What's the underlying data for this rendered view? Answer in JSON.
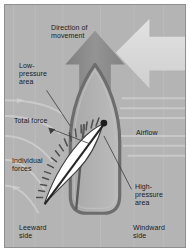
{
  "figure": {
    "background_color": "#b4b4b4",
    "border_color": "#8f8f8f",
    "page_color": "#ffffff"
  },
  "labels": {
    "direction_of_movement": "Direction of\nmovement",
    "low_pressure_area": "Low-\npressure\narea",
    "total_force": "Total force",
    "individual_forces": "Individual\nforces",
    "airflow": "Airflow",
    "high_pressure_area": "High-\npressure\narea",
    "leeward_side": "Leeward\nside",
    "windward_side": "Windward\nside"
  },
  "graphics": {
    "movement_arrow": {
      "name": "movement-arrow",
      "direction": "up",
      "color": "#8d8d8d"
    },
    "wind_arrow": {
      "name": "wind-arrow",
      "direction": "left",
      "color": "#d9d9d9"
    },
    "hull": {
      "name": "boat-hull",
      "outline_color": "#6e6e6e",
      "fill_color": "#b0b0b0"
    },
    "sail": {
      "name": "sail",
      "fill_color": "#ffffff",
      "outline_color": "#4a4a4a"
    },
    "total_force_vector": {
      "name": "total-force-vector",
      "color": "#2b2b2b"
    },
    "individual_force_marks": {
      "name": "individual-force-marks",
      "color": "#555555",
      "count": 22
    },
    "streamlines": {
      "name": "airflow-streamlines",
      "color": "#cfcfcf",
      "count": 11
    }
  }
}
